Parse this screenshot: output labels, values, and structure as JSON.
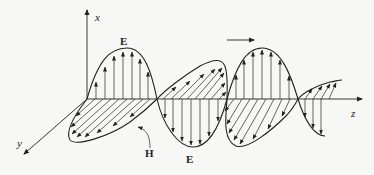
{
  "diagram": {
    "labels": {
      "x_axis": "x",
      "y_axis": "y",
      "z_axis": "z",
      "e_top": "E",
      "e_bottom": "E",
      "h": "H"
    },
    "propagation_arrow": "right",
    "colors": {
      "ink": "#222222",
      "background": "#f7f7f5",
      "bleed_text": "#e4e4e4"
    }
  }
}
